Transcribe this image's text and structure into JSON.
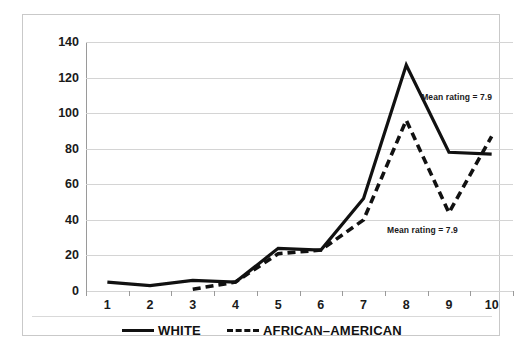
{
  "chart_data": {
    "type": "line",
    "title": "",
    "xlabel": "",
    "ylabel": "",
    "categories": [
      "1",
      "2",
      "3",
      "4",
      "5",
      "6",
      "7",
      "8",
      "9",
      "10"
    ],
    "ylim": [
      0,
      140
    ],
    "ytick_labels": [
      "0",
      "20",
      "40",
      "60",
      "80",
      "100",
      "120",
      "140"
    ],
    "ytick_values": [
      0,
      20,
      40,
      60,
      80,
      100,
      120,
      140
    ],
    "grid": true,
    "legend_position": "bottom-center",
    "series": [
      {
        "name": "WHITE",
        "style": "solid",
        "color": "#111111",
        "x": [
          1,
          2,
          3,
          4,
          5,
          6,
          7,
          8,
          9,
          10
        ],
        "values": [
          5,
          3,
          6,
          5,
          24,
          23,
          52,
          127,
          78,
          77
        ]
      },
      {
        "name": "AFRICAN–AMERICAN",
        "style": "dashed",
        "color": "#111111",
        "x": [
          3,
          4,
          5,
          6,
          7,
          8,
          9,
          10
        ],
        "values": [
          1,
          5,
          21,
          23,
          40,
          96,
          44,
          87
        ]
      }
    ],
    "annotations": [
      {
        "text": "Mean rating = 7.9",
        "x": 8.35,
        "y": 112
      },
      {
        "text": "Mean rating = 7.9",
        "x": 7.55,
        "y": 37
      }
    ]
  },
  "legend": {
    "items": [
      {
        "label": "WHITE",
        "style": "solid"
      },
      {
        "label": "AFRICAN–AMERICAN",
        "style": "dashed"
      }
    ]
  }
}
